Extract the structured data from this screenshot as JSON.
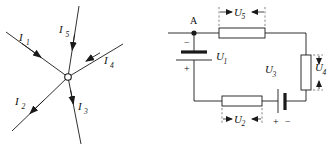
{
  "figure": {
    "title": "",
    "panels": [
      {
        "id": "left-panel",
        "name": "current-node-diagram",
        "description": "Five current branches meeting at a single node",
        "node_label": "",
        "branches": [
          {
            "label": "I",
            "subscript": "1",
            "name": "current-i1",
            "direction": "into-node",
            "angle_deg": 205
          },
          {
            "label": "I",
            "subscript": "2",
            "name": "current-i2",
            "direction": "out-of-node",
            "angle_deg": 148
          },
          {
            "label": "I",
            "subscript": "3",
            "name": "current-i3",
            "direction": "into-node",
            "angle_deg": 72
          },
          {
            "label": "I",
            "subscript": "4",
            "name": "current-i4",
            "direction": "into-node",
            "angle_deg": 330
          },
          {
            "label": "I",
            "subscript": "5",
            "name": "current-i5",
            "direction": "into-node",
            "angle_deg": 253
          }
        ]
      },
      {
        "id": "right-panel",
        "name": "circuit-loop-diagram",
        "description": "Closed circuit loop with two sources and three resistors",
        "node_a_label": "A",
        "elements": [
          {
            "name": "voltage-u1",
            "label": "U",
            "subscript": "1",
            "type": "battery",
            "orientation": "vertical",
            "polarity_top": "−",
            "polarity_bottom": "+"
          },
          {
            "name": "voltage-u2",
            "label": "U",
            "subscript": "2",
            "type": "resistor-dimension",
            "orientation": "horizontal"
          },
          {
            "name": "voltage-u3",
            "label": "U",
            "subscript": "3",
            "type": "battery",
            "orientation": "vertical-plates",
            "polarity_left": "+",
            "polarity_right": "−"
          },
          {
            "name": "voltage-u4",
            "label": "U",
            "subscript": "4",
            "type": "resistor-dimension",
            "orientation": "vertical"
          },
          {
            "name": "voltage-u5",
            "label": "U",
            "subscript": "5",
            "type": "resistor-dimension",
            "orientation": "horizontal"
          }
        ]
      }
    ]
  },
  "colors": {
    "stroke": "#1a1a1a",
    "dimension": "#555555",
    "background": "#ffffff",
    "resistor_fill": "#ffffff"
  },
  "labels": {
    "i1": "I",
    "i1_sub": "1",
    "i2": "I",
    "i2_sub": "2",
    "i3": "I",
    "i3_sub": "3",
    "i4": "I",
    "i4_sub": "4",
    "i5": "I",
    "i5_sub": "5",
    "u1": "U",
    "u1_sub": "1",
    "u2": "U",
    "u2_sub": "2",
    "u3": "U",
    "u3_sub": "3",
    "u4": "U",
    "u4_sub": "4",
    "u5": "U",
    "u5_sub": "5",
    "node_a": "A",
    "minus": "−",
    "plus": "+",
    "u3_plus": "+",
    "u3_minus": "−"
  }
}
